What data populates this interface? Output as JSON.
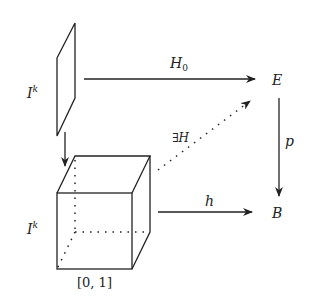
{
  "diagram": {
    "nodes": {
      "face_label": {
        "base": "I",
        "sup": "k"
      },
      "cube_label": {
        "base": "I",
        "sup": "k"
      },
      "interval_label": "[0, 1]",
      "E": "E",
      "B": "B"
    },
    "arrows": {
      "H0": {
        "base": "H",
        "sub": "0",
        "from": "I^k",
        "to": "E",
        "style": "solid"
      },
      "H": {
        "label": "∃H",
        "from": "I^k × [0,1]",
        "to": "E",
        "style": "dotted"
      },
      "h": {
        "label": "h",
        "from": "I^k × [0,1]",
        "to": "B",
        "style": "solid"
      },
      "p": {
        "label": "p",
        "from": "E",
        "to": "B",
        "style": "solid"
      },
      "inclusion": {
        "label": "",
        "from": "I^k",
        "to": "I^k × [0,1]",
        "style": "solid"
      }
    },
    "colors": {
      "stroke": "#222222",
      "background": "#ffffff"
    }
  }
}
